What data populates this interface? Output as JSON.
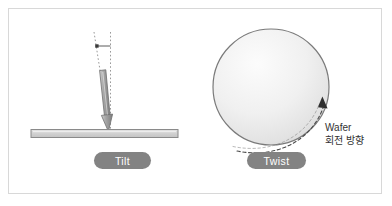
{
  "figure": {
    "background_color": "#ffffff",
    "frame_color": "#d8d8d8"
  },
  "colors": {
    "pill_fill": "#838383",
    "pill_text": "#ffffff",
    "wafer_bar_fill": "#d5d5d5",
    "wafer_bar_stroke": "#8a8a8a",
    "circle_stroke": "#7a7a7a",
    "circle_fill_center": "#fbfbfb",
    "circle_fill_edge": "#dcdcdc",
    "beam_arrow_fill": "#9e9e9e",
    "beam_arrow_stroke": "#6f6f6f",
    "dotted_line": "#9a9a9a",
    "dashed_arc": "#4a4a4a",
    "label_text": "#333333",
    "watermark_text": "#e2e2e2"
  },
  "tilt_panel": {
    "label": "Tilt",
    "icon_vertical_guide": "vertical-dotted-reference-line",
    "icon_tilted_guide": "tilted-dotted-beam-axis-line",
    "icon_angle_marker": "tilt-angle-marker",
    "icon_beam_arrow": "ion-beam-arrow",
    "icon_wafer_bar": "wafer-cross-section-bar"
  },
  "twist_panel": {
    "label": "Twist",
    "icon_wafer_circle": "wafer-top-view-circle",
    "icon_rotation_arrow": "rotation-direction-dashed-arrow",
    "rotation_label_line1": "Wafer",
    "rotation_label_line2": "회전 방향"
  },
  "watermark": {
    "text": ""
  }
}
